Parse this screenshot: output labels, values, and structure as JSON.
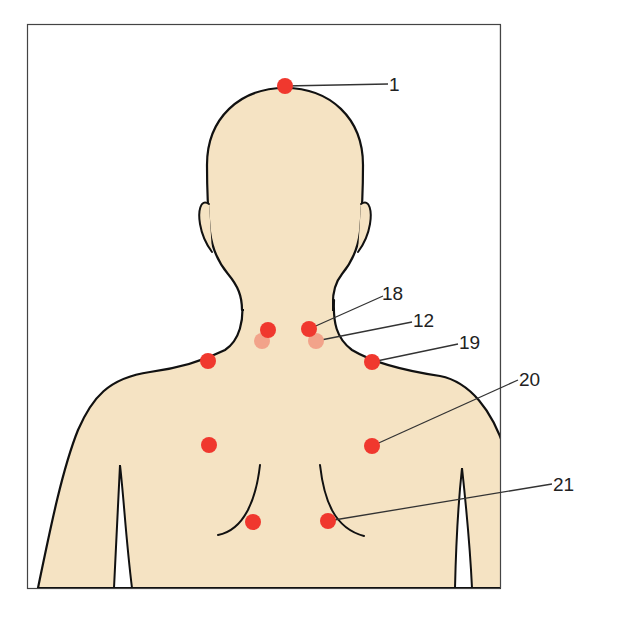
{
  "diagram": {
    "colors": {
      "skin": "#f5e3c3",
      "outline": "#111111",
      "point": "#f0382e",
      "point_faded": "#f2a38a",
      "leader": "#333333",
      "frame": "#444444"
    },
    "points": [
      {
        "id": "p1",
        "label": "1",
        "cx": 285,
        "cy": 86,
        "faded": false
      },
      {
        "id": "p18",
        "label": "18",
        "cx": 309,
        "cy": 329,
        "faded": false
      },
      {
        "id": "p12",
        "label": "12",
        "cx": 316,
        "cy": 341,
        "faded": true
      },
      {
        "id": "p19",
        "label": "19",
        "cx": 372,
        "cy": 362,
        "faded": false
      },
      {
        "id": "p20",
        "label": "20",
        "cx": 372,
        "cy": 446,
        "faded": false
      },
      {
        "id": "p21",
        "label": "21",
        "cx": 328,
        "cy": 521,
        "faded": false
      },
      {
        "id": "l-neck",
        "label": "",
        "cx": 268,
        "cy": 330,
        "faded": false
      },
      {
        "id": "l-neck-faded",
        "label": "",
        "cx": 262,
        "cy": 341,
        "faded": true
      },
      {
        "id": "l-shoulder",
        "label": "",
        "cx": 208,
        "cy": 361,
        "faded": false
      },
      {
        "id": "l-chest",
        "label": "",
        "cx": 209,
        "cy": 445,
        "faded": false
      },
      {
        "id": "l-lower",
        "label": "",
        "cx": 253,
        "cy": 522,
        "faded": false
      }
    ],
    "labels": {
      "p1": "1",
      "p18": "18",
      "p12": "12",
      "p19": "19",
      "p20": "20",
      "p21": "21"
    }
  }
}
